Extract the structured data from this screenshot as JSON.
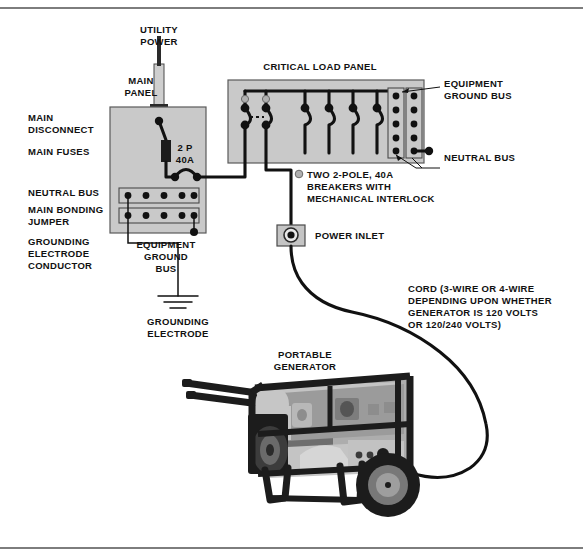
{
  "figure": {
    "background_color": "#ffffff",
    "line_color": "#111111",
    "panel_fill_color": "#c9c9c9",
    "border_rule_color": "#7d7d7d"
  },
  "labels": {
    "utility_power": "UTILITY\nPOWER",
    "utility_power_l1": "UTILITY",
    "utility_power_l2": "POWER",
    "main_panel_l1": "MAIN",
    "main_panel_l2": "PANEL",
    "main_disconnect_l1": "MAIN",
    "main_disconnect_l2": "DISCONNECT",
    "main_fuses": "MAIN  FUSES",
    "neutral_bus_left": "NEUTRAL  BUS",
    "main_bonding_l1": "MAIN  BONDING",
    "main_bonding_l2": "JUMPER",
    "grounding_electrode_conductor_l1": "GROUNDING",
    "grounding_electrode_conductor_l2": "ELECTRODE",
    "grounding_electrode_conductor_l3": "CONDUCTOR",
    "equipment_ground_bus_main_l1": "EQUIPMENT",
    "equipment_ground_bus_main_l2": "GROUND",
    "equipment_ground_bus_main_l3": "BUS",
    "grounding_electrode_l1": "GROUNDING",
    "grounding_electrode_l2": "ELECTRODE",
    "breaker_rating_l1": "2 P",
    "breaker_rating_l2": "40A",
    "critical_load_panel": "CRITICAL  LOAD  PANEL",
    "equipment_ground_bus_right_l1": "EQUIPMENT",
    "equipment_ground_bus_right_l2": "GROUND BUS",
    "neutral_bus_right": "NEUTRAL BUS",
    "interlock_note_l1": "TWO 2-POLE, 40A",
    "interlock_note_l2": "BREAKERS  WITH",
    "interlock_note_l3": "MECHANICAL  INTERLOCK",
    "power_inlet": "POWER  INLET",
    "cord_note_l1": "CORD (3-WIRE  OR  4-WIRE",
    "cord_note_l2": "DEPENDING  UPON  WHETHER",
    "cord_note_l3": "GENERATOR  IS  120  VOLTS",
    "cord_note_l4": "OR  120/240  VOLTS)",
    "portable_generator_l1": "PORTABLE",
    "portable_generator_l2": "GENERATOR"
  },
  "components": {
    "main_panel": {
      "name": "MAIN PANEL",
      "breaker": "2 P 40A",
      "neutral_bus_dots": 5,
      "equipment_ground_bus_dots": 5
    },
    "critical_load_panel": {
      "name": "CRITICAL LOAD PANEL",
      "interlocked_breakers": 2,
      "branch_breakers": 4,
      "equipment_ground_bus_dots": 5,
      "neutral_bus_dots": 5
    },
    "power_inlet": {
      "name": "POWER INLET"
    },
    "generator": {
      "name": "PORTABLE GENERATOR",
      "wheels": 1,
      "handles": 2
    }
  }
}
